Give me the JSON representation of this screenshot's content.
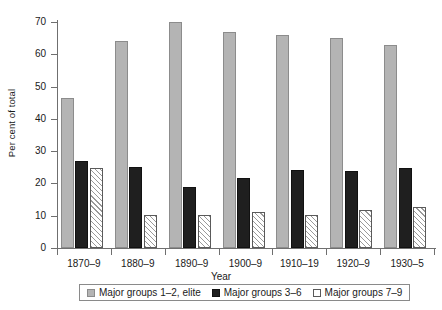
{
  "chart_data": {
    "type": "bar",
    "title": "",
    "subtitle": "",
    "xlabel": "Year",
    "ylabel": "Per cent of total",
    "categories": [
      "1870–9",
      "1880–9",
      "1890–9",
      "1900–9",
      "1910–19",
      "1920–9",
      "1930–5"
    ],
    "series": [
      {
        "name": "Major groups 1–2, elite",
        "color": "#b4b4b4",
        "fill": "solid-gray",
        "values": [
          46.5,
          64.0,
          70.0,
          67.0,
          66.0,
          65.0,
          63.0
        ]
      },
      {
        "name": "Major groups 3–6",
        "color": "#1f1f1f",
        "fill": "solid-black",
        "values": [
          27.0,
          25.0,
          18.8,
          21.8,
          24.2,
          23.8,
          24.8
        ]
      },
      {
        "name": "Major groups 7–9",
        "color": "#ffffff",
        "fill": "diagonal-hatch",
        "values": [
          24.8,
          10.3,
          10.2,
          11.3,
          10.3,
          11.7,
          12.6
        ]
      }
    ],
    "ylim": [
      0,
      70
    ],
    "yticks": [
      0,
      10,
      20,
      30,
      40,
      50,
      60,
      70
    ],
    "ytick_labels": [
      "0",
      "10",
      "20",
      "30",
      "40",
      "50",
      "60",
      "70"
    ],
    "grid": false,
    "legend_position": "bottom"
  },
  "axes": {
    "y_title": "Per cent of total",
    "x_title": "Year"
  },
  "legend": {
    "entries": [
      "Major groups 1–2, elite",
      "Major groups 3–6",
      "Major groups 7–9"
    ]
  }
}
